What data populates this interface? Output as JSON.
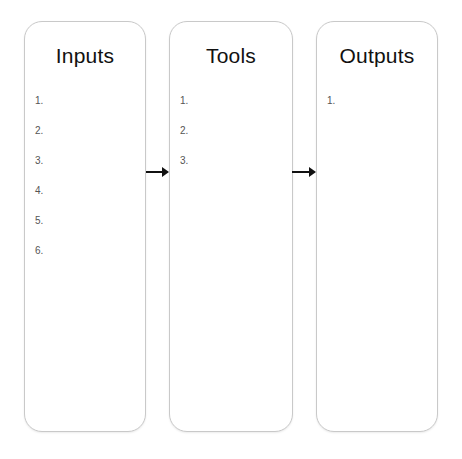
{
  "columns": [
    {
      "title": "Inputs",
      "items": [
        "1.",
        "2.",
        "3.",
        "4.",
        "5.",
        "6."
      ]
    },
    {
      "title": "Tools",
      "items": [
        "1.",
        "2.",
        "3."
      ]
    },
    {
      "title": "Outputs",
      "items": [
        "1."
      ]
    }
  ],
  "arrows": [
    {
      "from": "Inputs",
      "to": "Tools"
    },
    {
      "from": "Tools",
      "to": "Outputs"
    }
  ],
  "colors": {
    "border": "#c9c9c9",
    "title": "#111111",
    "item": "#555555",
    "arrow": "#111111"
  }
}
